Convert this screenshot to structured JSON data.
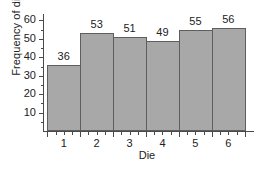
{
  "chart_data": {
    "type": "bar",
    "title": "",
    "xlabel": "Die",
    "ylabel": "Frequency of die",
    "categories": [
      "1",
      "2",
      "3",
      "4",
      "5",
      "6"
    ],
    "values": [
      36,
      53,
      51,
      49,
      55,
      56
    ],
    "data_labels": [
      "36",
      "53",
      "51",
      "49",
      "55",
      "56"
    ],
    "ylim": [
      0,
      63.5
    ],
    "ytick_labels": [
      "10",
      "20",
      "30",
      "40",
      "50",
      "60"
    ],
    "ytick_values": [
      10,
      20,
      30,
      40,
      50,
      60
    ],
    "yminor_values": [
      5,
      15,
      25,
      35,
      45,
      55
    ],
    "xtick_boundaries": [
      0.5,
      1.5,
      2.5,
      3.5,
      4.5,
      5.5,
      6.5
    ],
    "grid": false,
    "legend": false,
    "bar_fill_color": "#a8a8a8",
    "bar_edge_color": "#5e5e5e",
    "axis_color": "#4a4a4a",
    "background_color": "#ffffff"
  }
}
